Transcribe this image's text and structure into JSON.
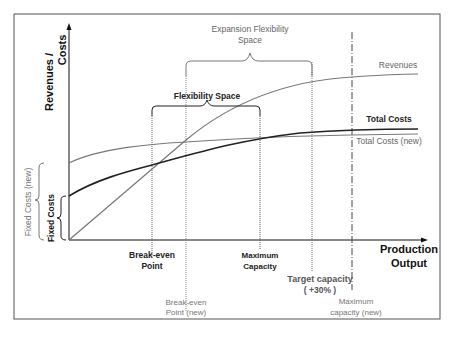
{
  "diagram": {
    "axes": {
      "y_label_line1": "Revenues /",
      "y_label_line2": "Costs",
      "x_label_line1": "Production",
      "x_label_line2": "Output"
    },
    "curves": {
      "revenues": "Revenues",
      "total_costs": "Total Costs",
      "total_costs_new": "Total Costs (new)"
    },
    "braces": {
      "flexibility_space": "Flexibility Space",
      "expansion_line1": "Expansion Flexibility",
      "expansion_line2": "Space",
      "fixed_costs": "Fixed Costs",
      "fixed_costs_new": "Fixed Costs (new)"
    },
    "markers": {
      "break_even_line1": "Break-even",
      "break_even_line2": "Point",
      "break_even_new_line1": "Break-even",
      "break_even_new_line2": "Point (new)",
      "max_capacity_line1": "Maximum",
      "max_capacity_line2": "Capacity",
      "target_line1": "Target capacity",
      "target_line2": "( +30% )",
      "max_capacity_new_line1": "Maximum",
      "max_capacity_new_line2": "capacity (new)"
    },
    "colors": {
      "dark": "#1a1a1a",
      "gray": "#6e6e6e",
      "light_gray": "#8a8a8a",
      "frame": "#444444"
    }
  }
}
